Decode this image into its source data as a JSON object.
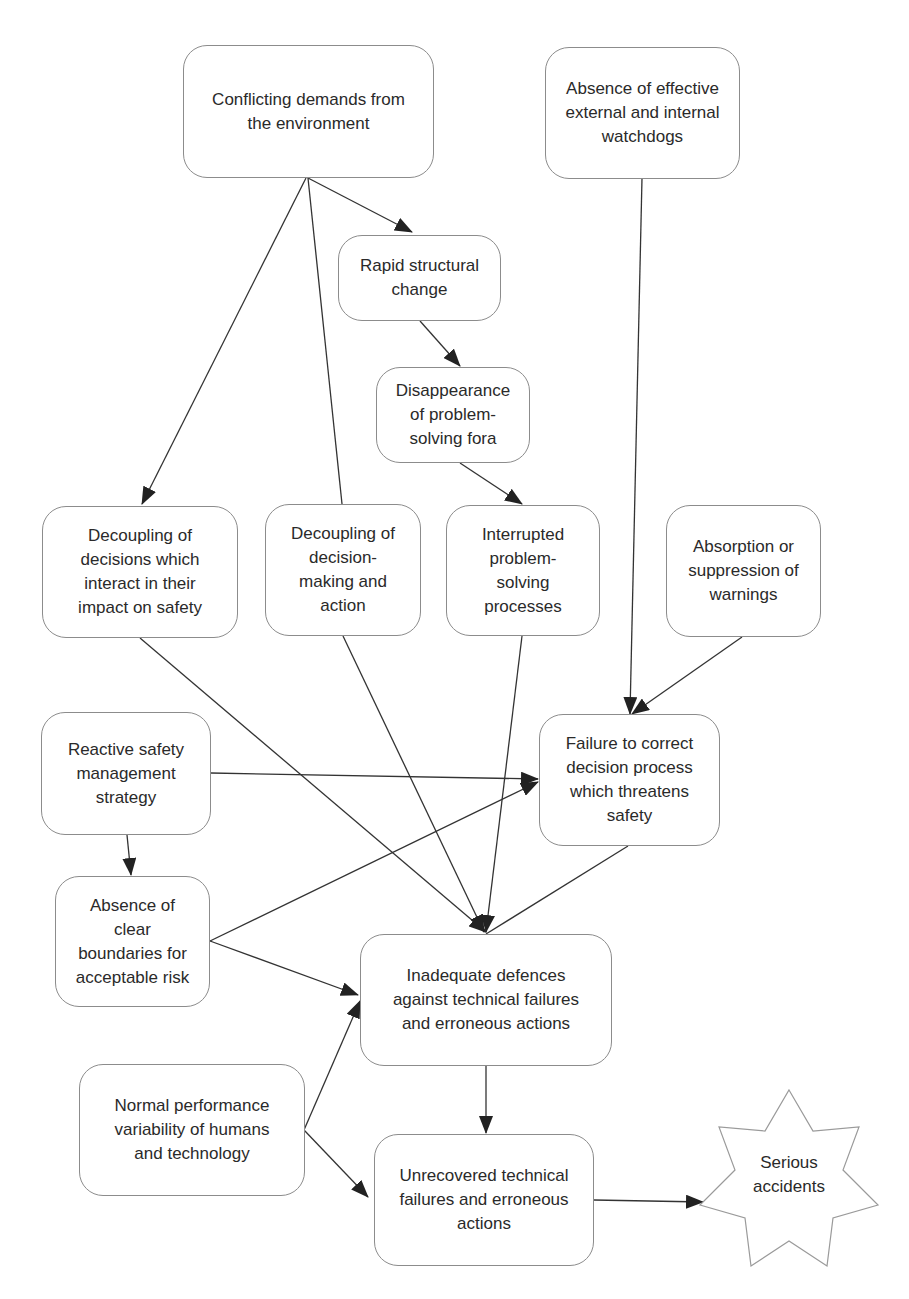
{
  "diagram": {
    "type": "causal-flow",
    "nodes": {
      "conflicting_demands": {
        "label": "Conflicting demands from\nthe environment"
      },
      "absence_watchdogs": {
        "label": "Absence of effective\nexternal and internal\nwatchdogs"
      },
      "rapid_change": {
        "label": "Rapid structural\nchange"
      },
      "disappearance_fora": {
        "label": "Disappearance\nof problem-\nsolving fora"
      },
      "decoupling_decisions": {
        "label": "Decoupling of\ndecisions which\ninteract in their\nimpact on safety"
      },
      "decoupling_action": {
        "label": "Decoupling of\ndecision-\nmaking and\naction"
      },
      "interrupted_processes": {
        "label": "Interrupted\nproblem-\nsolving\nprocesses"
      },
      "absorption_warnings": {
        "label": "Absorption or\nsuppression of\nwarnings"
      },
      "reactive_strategy": {
        "label": "Reactive safety\nmanagement\nstrategy"
      },
      "failure_correct": {
        "label": "Failure to correct\ndecision process\nwhich threatens\nsafety"
      },
      "absence_boundaries": {
        "label": "Absence of\nclear\nboundaries for\nacceptable risk"
      },
      "inadequate_defences": {
        "label": "Inadequate defences\nagainst technical failures\nand erroneous actions"
      },
      "normal_variability": {
        "label": "Normal performance\nvariability of humans\nand technology"
      },
      "unrecovered_failures": {
        "label": "Unrecovered technical\nfailures and erroneous\nactions"
      },
      "serious_accidents": {
        "label": "Serious\naccidents",
        "shape": "7-point-star"
      }
    },
    "edges": [
      {
        "from": "conflicting_demands",
        "to": "rapid_change"
      },
      {
        "from": "conflicting_demands",
        "to": "decoupling_decisions"
      },
      {
        "from": "conflicting_demands",
        "to": "decoupling_action",
        "arrow": false
      },
      {
        "from": "rapid_change",
        "to": "disappearance_fora"
      },
      {
        "from": "disappearance_fora",
        "to": "interrupted_processes"
      },
      {
        "from": "absence_watchdogs",
        "to": "failure_correct"
      },
      {
        "from": "absorption_warnings",
        "to": "failure_correct"
      },
      {
        "from": "decoupling_decisions",
        "to": "inadequate_defences"
      },
      {
        "from": "decoupling_action",
        "to": "inadequate_defences"
      },
      {
        "from": "interrupted_processes",
        "to": "inadequate_defences"
      },
      {
        "from": "failure_correct",
        "to": "inadequate_defences"
      },
      {
        "from": "reactive_strategy",
        "to": "failure_correct"
      },
      {
        "from": "reactive_strategy",
        "to": "absence_boundaries"
      },
      {
        "from": "absence_boundaries",
        "to": "failure_correct"
      },
      {
        "from": "absence_boundaries",
        "to": "inadequate_defences"
      },
      {
        "from": "normal_variability",
        "to": "inadequate_defences"
      },
      {
        "from": "normal_variability",
        "to": "unrecovered_failures"
      },
      {
        "from": "inadequate_defences",
        "to": "unrecovered_failures"
      },
      {
        "from": "unrecovered_failures",
        "to": "serious_accidents"
      }
    ],
    "colors": {
      "border": "#8c8c8c",
      "edge": "#333333",
      "text": "#2a2a2a",
      "background": "#ffffff"
    }
  }
}
